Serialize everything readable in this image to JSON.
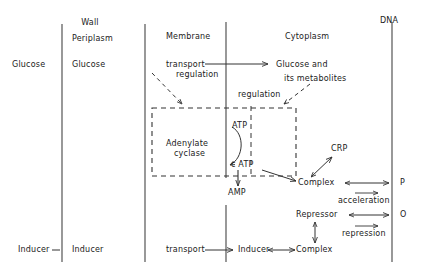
{
  "diagram": {
    "title_labels": {
      "wall": "Wall",
      "periplasm": "Periplasm",
      "membrane": "Membrane",
      "cytoplasm": "Cytoplasm",
      "dna": "DNA"
    },
    "nodes": {
      "glucose_out": "Glucose",
      "glucose_peri": "Glucose",
      "transport_top": "transport",
      "regulation_top": "regulation",
      "glucose_metab_l1": "Glucose and",
      "glucose_metab_l2": "its metabolites",
      "regulation_mid": "regulation",
      "adenylate_l1": "Adenylate",
      "adenylate_l2": "cyclase",
      "atp": "ATP",
      "c_atp": "c ATP",
      "amp": "AMP",
      "crp": "CRP",
      "complex_top": "Complex",
      "acceleration": "acceleration",
      "repressor": "Repressor",
      "repression": "repression",
      "complex_bottom": "Complex",
      "inducer_out": "Inducer",
      "inducer_peri": "Inducer",
      "transport_bottom": "transport",
      "inducer_cyto": "Inducer",
      "site_p": "P",
      "site_o": "O"
    },
    "colors": {
      "stroke": "#333333",
      "text": "#1a1a1a",
      "background": "#ffffff"
    }
  }
}
